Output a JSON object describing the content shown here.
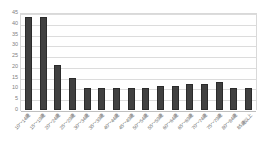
{
  "chart_data": {
    "type": "bar",
    "title": "",
    "subtitle": "",
    "xlabel": "",
    "ylabel": "",
    "ylim": [
      0,
      45
    ],
    "ytick_step": 5,
    "yticks": [
      45,
      40,
      35,
      30,
      25,
      20,
      15,
      10,
      5,
      0
    ],
    "grid": true,
    "legend": false,
    "legend_position": "none",
    "bar_color": "#404040",
    "grid_color": "#dcdcdc",
    "axis_text_color": "#7f7f7f",
    "categories": [
      "10～14歳",
      "15～19歳",
      "20～24歳",
      "25～29歳",
      "30～34歳",
      "35～39歳",
      "40～44歳",
      "45～49歳",
      "50～54歳",
      "55～59歳",
      "60～64歳",
      "65～69歳",
      "70～74歳",
      "75～79歳",
      "80～84歳",
      "85歳以上"
    ],
    "values": [
      43,
      43,
      21,
      15,
      10,
      10,
      10,
      10,
      10,
      11,
      11,
      12,
      12,
      13,
      10,
      10
    ]
  }
}
